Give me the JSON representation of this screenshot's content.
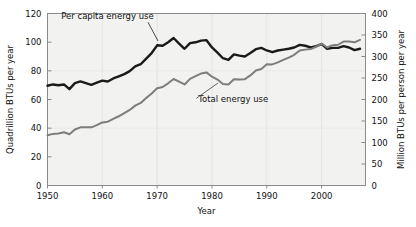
{
  "chart_data": {
    "type": "line",
    "title": "",
    "xlabel": "Year",
    "ylabel": "Quadrillion BTUs per year",
    "y2label": "Million BTUs per person per year",
    "xlim": [
      1950,
      2008
    ],
    "ylim": [
      0,
      120
    ],
    "y2lim": [
      0,
      400
    ],
    "grid": false,
    "legend_position": "inline-annotations",
    "xticks": [
      1950,
      1960,
      1970,
      1980,
      1990,
      2000
    ],
    "xtick_labels": [
      "1950",
      "1960",
      "1970",
      "1980",
      "1990",
      "2000"
    ],
    "yticks": [
      0,
      20,
      40,
      60,
      80,
      100,
      120
    ],
    "ytick_labels": [
      "0",
      "20",
      "40",
      "60",
      "80",
      "100",
      "120"
    ],
    "y2ticks": [
      0,
      50,
      100,
      150,
      200,
      250,
      300,
      350,
      400
    ],
    "y2tick_labels": [
      "0",
      "50",
      "100",
      "150",
      "200",
      "250",
      "300",
      "350",
      "400"
    ],
    "annotations": [
      {
        "text": "Per capita energy use",
        "x": 1952.5,
        "y": 116,
        "series": "per_capita"
      },
      {
        "text": "Total energy use",
        "x": 1977.5,
        "y": 58,
        "series": "total"
      }
    ],
    "series": [
      {
        "name": "Per capita energy use",
        "axis": "right",
        "units": "Million BTUs per person per year",
        "color": "#1a1a1a",
        "x": [
          1950,
          1951,
          1952,
          1953,
          1954,
          1955,
          1956,
          1957,
          1958,
          1959,
          1960,
          1961,
          1962,
          1963,
          1964,
          1965,
          1966,
          1967,
          1968,
          1969,
          1970,
          1971,
          1972,
          1973,
          1974,
          1975,
          1976,
          1977,
          1978,
          1979,
          1980,
          1981,
          1982,
          1983,
          1984,
          1985,
          1986,
          1987,
          1988,
          1989,
          1990,
          1991,
          1992,
          1993,
          1994,
          1995,
          1996,
          1997,
          1998,
          1999,
          2000,
          2001,
          2002,
          2003,
          2004,
          2005,
          2006,
          2007
        ],
        "values": [
          232,
          235,
          233,
          235,
          224,
          238,
          242,
          238,
          234,
          239,
          244,
          242,
          249,
          254,
          259,
          266,
          277,
          282,
          295,
          308,
          326,
          325,
          333,
          343,
          330,
          318,
          331,
          333,
          337,
          338,
          321,
          309,
          296,
          292,
          305,
          302,
          300,
          308,
          317,
          320,
          314,
          310,
          314,
          316,
          318,
          321,
          327,
          325,
          321,
          324,
          329,
          318,
          320,
          320,
          324,
          321,
          315,
          318
        ]
      },
      {
        "name": "Total energy use",
        "axis": "left",
        "units": "Quadrillion BTUs per year",
        "color": "#7d7d7d",
        "x": [
          1950,
          1951,
          1952,
          1953,
          1954,
          1955,
          1956,
          1957,
          1958,
          1959,
          1960,
          1961,
          1962,
          1963,
          1964,
          1965,
          1966,
          1967,
          1968,
          1969,
          1970,
          1971,
          1972,
          1973,
          1974,
          1975,
          1976,
          1977,
          1978,
          1979,
          1980,
          1981,
          1982,
          1983,
          1984,
          1985,
          1986,
          1987,
          1988,
          1989,
          1990,
          1991,
          1992,
          1993,
          1994,
          1995,
          1996,
          1997,
          1998,
          1999,
          2000,
          2001,
          2002,
          2003,
          2004,
          2005,
          2006,
          2007
        ],
        "values": [
          35.0,
          36.0,
          36.3,
          37.1,
          35.8,
          39.1,
          40.6,
          40.7,
          40.6,
          42.1,
          44.0,
          44.5,
          46.5,
          48.3,
          50.5,
          52.7,
          55.7,
          57.6,
          61.0,
          64.2,
          67.8,
          68.7,
          71.3,
          74.3,
          72.5,
          70.5,
          74.4,
          76.3,
          78.1,
          78.9,
          75.9,
          73.9,
          70.8,
          70.5,
          74.1,
          73.9,
          74.2,
          76.8,
          80.2,
          81.3,
          84.6,
          84.5,
          85.9,
          87.6,
          89.2,
          91.2,
          94.2,
          94.8,
          95.2,
          96.8,
          98.9,
          96.3,
          97.9,
          98.2,
          100.4,
          100.5,
          99.9,
          101.6
        ]
      }
    ]
  },
  "labels": {
    "y_axis_title": "Quadrillion BTUs per year",
    "y2_axis_title": "Million BTUs per person per year",
    "x_axis_title": "Year",
    "annot_per_capita": "Per capita energy use",
    "annot_total": "Total energy use"
  },
  "colors": {
    "per_capita_line": "#1a1a1a",
    "total_line": "#7d7d7d",
    "plot_background": "#f2f2f0",
    "axis": "#8a8a8a",
    "text": "#111111"
  }
}
